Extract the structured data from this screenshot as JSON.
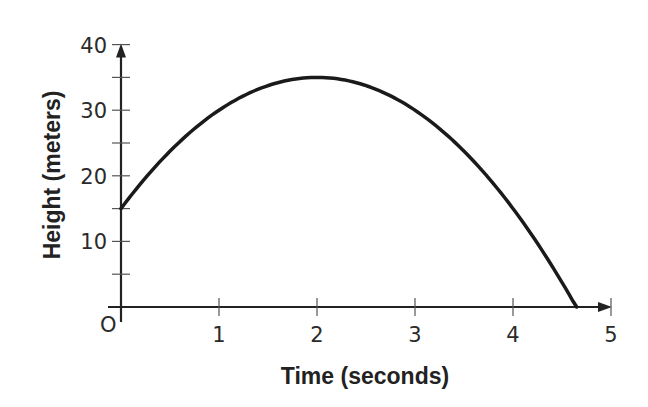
{
  "chart_data": {
    "type": "line",
    "title": "",
    "xlabel": "Time (seconds)",
    "ylabel": "Height (meters)",
    "origin_label": "O",
    "xlim": [
      0,
      5
    ],
    "ylim": [
      0,
      40
    ],
    "x_ticks": [
      1,
      2,
      3,
      4,
      5
    ],
    "x_tick_labels": [
      "1",
      "2",
      "3",
      "4",
      "5"
    ],
    "y_ticks": [
      5,
      10,
      15,
      20,
      25,
      30,
      35,
      40
    ],
    "y_tick_labels": [
      "10",
      "20",
      "30",
      "40"
    ],
    "grid": false,
    "legend": null,
    "series": [
      {
        "name": "height",
        "equation": "h(t) = -5t^2 + 20t + 15",
        "x": [
          0,
          0.5,
          1,
          1.5,
          2,
          2.5,
          3,
          3.5,
          4,
          4.5,
          4.65
        ],
        "y": [
          15,
          23.75,
          30,
          33.75,
          35,
          33.75,
          30,
          23.75,
          15,
          3.75,
          0
        ]
      }
    ],
    "key_points": {
      "start": [
        0,
        15
      ],
      "vertex": [
        2,
        35
      ],
      "x_intercept": [
        4.65,
        0
      ]
    }
  },
  "colors": {
    "curve": "#1a1a1a",
    "axis": "#222222",
    "text": "#2a2a2a",
    "background": "#ffffff"
  }
}
